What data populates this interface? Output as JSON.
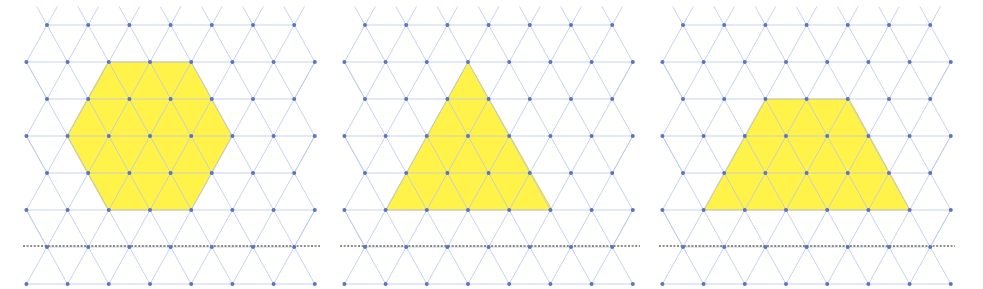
{
  "figure": {
    "colors": {
      "fill": "#FFF34A",
      "grid_line": "#B9C8EA",
      "dot": "#5B74C0",
      "dashed_line": "#6B6A55",
      "background": "#FFFFFF"
    },
    "grid": {
      "spacing_x": 41.2,
      "row_height": 37.0,
      "rows": 8,
      "first_row_y": 25
    },
    "panels": [
      {
        "id": "panel-1",
        "shape": "hexagon",
        "offset_x": 0,
        "first_row_start_x": 47,
        "points": [
          [
            108,
            62
          ],
          [
            191,
            62
          ],
          [
            232,
            136
          ],
          [
            191,
            210
          ],
          [
            108,
            210
          ],
          [
            67,
            136
          ]
        ],
        "dashed_line": {
          "x1": 23,
          "x2": 320,
          "y": 246
        }
      },
      {
        "id": "panel-2",
        "shape": "triangle",
        "offset_x": 330,
        "first_row_start_x": 35,
        "points": [
          [
            138,
            62
          ],
          [
            222,
            210
          ],
          [
            56,
            210
          ]
        ],
        "dashed_line": {
          "x1": 10,
          "x2": 310,
          "y": 246
        }
      },
      {
        "id": "panel-3",
        "shape": "trapezoid",
        "offset_x": 655,
        "first_row_start_x": 28,
        "points": [
          [
            111,
            99
          ],
          [
            194,
            99
          ],
          [
            255,
            210
          ],
          [
            49,
            210
          ]
        ],
        "dashed_line": {
          "x1": 4,
          "x2": 300,
          "y": 246
        }
      }
    ]
  }
}
